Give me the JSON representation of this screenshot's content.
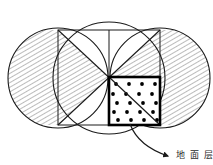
{
  "figure": {
    "canvas": {
      "width": 213,
      "height": 165,
      "background": "#ffffff"
    },
    "colors": {
      "stroke": "#1a1a1a",
      "hatch": "#4a4a4a",
      "dot": "#000000",
      "bold_stroke": "#000000",
      "background": "#ffffff",
      "arrow": "#1a1a1a",
      "text": "#2b2b2b"
    },
    "shapes": {
      "circumcircle": {
        "name": "large-circle",
        "cx": 109,
        "cy": 78,
        "r": 56,
        "stroke_width": 1.1,
        "fill": "none"
      },
      "left_circle": {
        "name": "left-circle",
        "cx": 58,
        "cy": 78,
        "r": 50,
        "stroke_width": 1.1,
        "fill": "none"
      },
      "right_circle": {
        "name": "right-circle",
        "cx": 160,
        "cy": 78,
        "r": 50,
        "stroke_width": 1.1,
        "fill": "none"
      },
      "square": {
        "name": "inscribed-square",
        "x": 58,
        "y": 30,
        "width": 102,
        "height": 95,
        "stroke_width": 1.0,
        "corners": [
          [
            58,
            30
          ],
          [
            160,
            30
          ],
          [
            160,
            125
          ],
          [
            58,
            125
          ]
        ]
      },
      "diagonal_main": {
        "name": "diagonal-top-left-to-bottom-right",
        "x1": 58,
        "y1": 30,
        "x2": 160,
        "y2": 125
      },
      "diagonal_anti": {
        "name": "diagonal-top-right-to-bottom-left",
        "x1": 160,
        "y1": 30,
        "x2": 58,
        "y2": 125
      },
      "vertical_median": {
        "name": "vertical-median-line",
        "x1": 109,
        "y1": 30,
        "x2": 109,
        "y2": 125
      },
      "center_point": {
        "name": "square-center",
        "x": 109,
        "y": 77.5
      },
      "dotted_square": {
        "name": "dotted-sub-square",
        "x": 109,
        "y": 77,
        "width": 51,
        "height": 48,
        "stroke_width": 2.6,
        "dot_radius": 1.9,
        "dot_rows": 5,
        "dot_cols": 4,
        "dot_count": 20
      }
    },
    "hatching": {
      "name": "diagonal-hatch-pattern",
      "angle_deg": 60,
      "spacing_px": 4,
      "line_width": 0.7,
      "regions": [
        "left-lune-outside-square",
        "left-upper-triangle-of-square",
        "right-lune-outside-square",
        "right-upper-triangle-of-square"
      ]
    },
    "annotation": {
      "name": "callout",
      "arrow": {
        "name": "callout-arrow",
        "path_start": [
          130,
          123
        ],
        "path_control": [
          142,
          148
        ],
        "path_end": [
          170,
          157
        ],
        "head_size": 6,
        "stroke_width": 1.2
      },
      "label": {
        "name": "callout-label",
        "text": "地 面 层",
        "x": 176,
        "y": 156,
        "font_size": 9,
        "clipped": true
      }
    }
  }
}
